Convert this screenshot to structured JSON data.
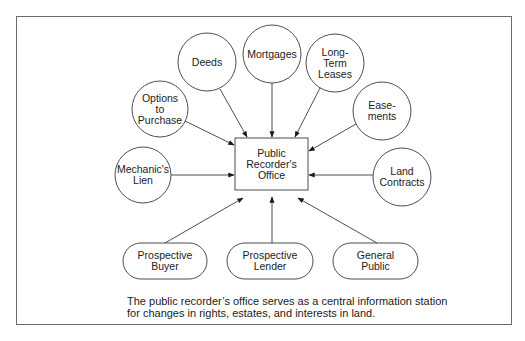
{
  "diagram": {
    "center": {
      "label": "Public Recorder's Office",
      "lines": [
        "Public",
        "Recorder's",
        "Office"
      ]
    },
    "inputs": [
      {
        "id": "deeds",
        "lines": [
          "Deeds"
        ],
        "shape": "circle"
      },
      {
        "id": "mortgages",
        "lines": [
          "Mortgages"
        ],
        "shape": "circle"
      },
      {
        "id": "long-term-leases",
        "lines": [
          "Long-",
          "Term",
          "Leases"
        ],
        "shape": "circle"
      },
      {
        "id": "options-to-purchase",
        "lines": [
          "Options",
          "to",
          "Purchase"
        ],
        "shape": "circle"
      },
      {
        "id": "easements",
        "lines": [
          "Ease-",
          "ments"
        ],
        "shape": "circle"
      },
      {
        "id": "mechanics-lien",
        "lines": [
          "Mechanic's",
          "Lien"
        ],
        "shape": "circle"
      },
      {
        "id": "land-contracts",
        "lines": [
          "Land",
          "Contracts"
        ],
        "shape": "circle"
      }
    ],
    "users": [
      {
        "id": "prospective-buyer",
        "lines": [
          "Prospective",
          "Buyer"
        ],
        "shape": "pill"
      },
      {
        "id": "prospective-lender",
        "lines": [
          "Prospective",
          "Lender"
        ],
        "shape": "pill"
      },
      {
        "id": "general-public",
        "lines": [
          "General",
          "Public"
        ],
        "shape": "pill"
      }
    ],
    "caption": {
      "line1": "The public recorder’s office serves as a central information station",
      "line2": "for changes in rights, estates, and interests in land."
    },
    "colors": {
      "stroke": "#3a3a3a",
      "frame": "#6a6a6a",
      "text": "#222222",
      "background": "#ffffff"
    }
  }
}
